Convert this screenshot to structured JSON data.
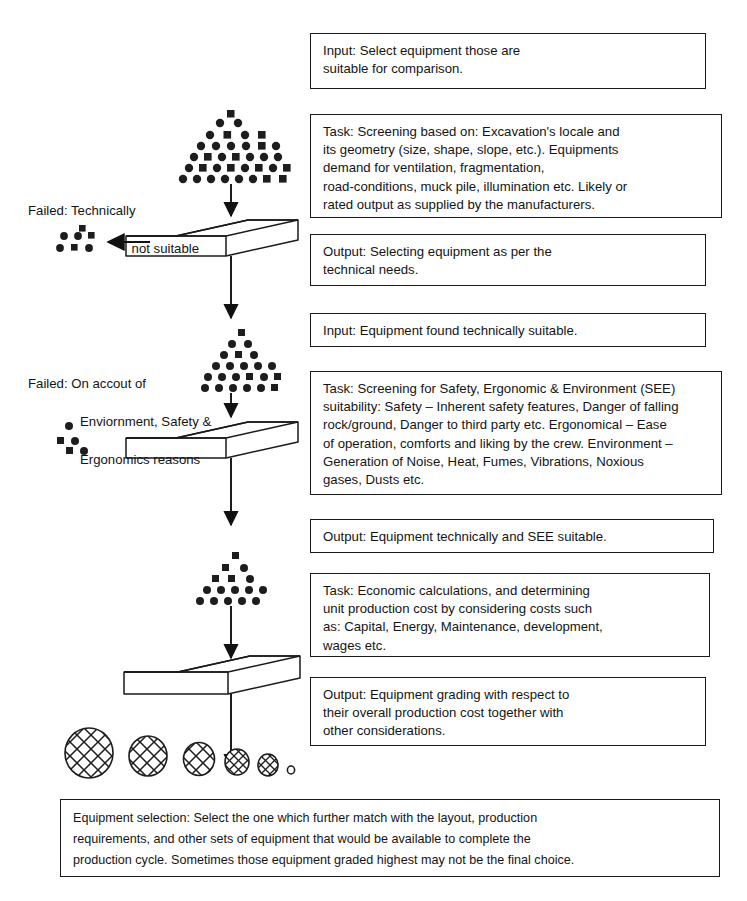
{
  "diagram": {
    "colors": {
      "ink": "#141414",
      "box_border": "#1a1a1a",
      "background": "#ffffff"
    },
    "boxes": [
      {
        "id": "input-1",
        "label": "Input: Select equipment those are\nsuitable for comparison."
      },
      {
        "id": "task-1",
        "label": "Task: Screening based on:  Excavation's locale and\nits geometry (size, shape, slope, etc.).  Equipments\ndemand for ventilation, fragmentation,\nroad-conditions, muck pile, illumination etc.  Likely or\nrated output as supplied by the manufacturers."
      },
      {
        "id": "output-1",
        "label": "Output:  Selecting equipment as per the\ntechnical needs."
      },
      {
        "id": "input-2",
        "label": "Input:  Equipment found technically suitable."
      },
      {
        "id": "task-2",
        "label": "Task:  Screening for Safety,  Ergonomic & Environment (SEE)\nsuitability: Safety – Inherent safety features, Danger of falling\nrock/ground,  Danger to third party etc.  Ergonomical –  Ease\nof operation, comforts and liking by the crew.  Environment –\nGeneration of Noise, Heat, Fumes, Vibrations, Noxious\ngases, Dusts etc."
      },
      {
        "id": "output-2",
        "label": "Output:  Equipment technically and SEE suitable."
      },
      {
        "id": "task-3",
        "label": "Task:  Economic calculations, and determining\nunit production cost by considering costs such\nas:  Capital, Energy, Maintenance, development,\nwages etc."
      },
      {
        "id": "output-3",
        "label": "Output:  Equipment grading with respect to\ntheir overall production cost together with\nother considerations."
      },
      {
        "id": "final-selection",
        "label": "Equipment selection:  Select the one which further match with the layout, production\nrequirements, and other sets of equipment that would be available to complete the\nproduction cycle.  Sometimes those equipment graded highest may not be the final choice."
      }
    ],
    "side_labels": [
      {
        "id": "failed-technical",
        "line1": "Failed:  Technically",
        "line2": "not suitable"
      },
      {
        "id": "failed-see",
        "line1": "Failed:  On accout of",
        "line2": "Enviornment, Safety &",
        "line3": "Ergonomics reasons"
      }
    ],
    "shapes": {
      "sieves": 3,
      "pyramids": 3,
      "reject_clusters": 2,
      "graded_ellipses": 5,
      "arrows": 6
    }
  }
}
